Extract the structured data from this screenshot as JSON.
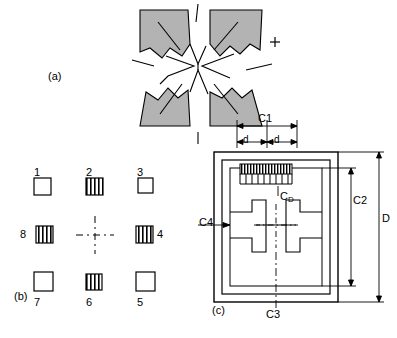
{
  "figure": {
    "panels": [
      {
        "id": "a",
        "label": "(a)",
        "description": "irregular shaded cross-shaped antenna element outline"
      },
      {
        "id": "b",
        "label": "(b)",
        "description": "array of eight numbered square elements around a dashed cross center"
      },
      {
        "id": "c",
        "label": "(c)",
        "description": "square patch layout with dimension callouts"
      }
    ]
  },
  "panel_b": {
    "label": "(b)",
    "elements": [
      {
        "number": "1",
        "position": "top-left",
        "fill": "open"
      },
      {
        "number": "2",
        "position": "top-center",
        "fill": "hatched"
      },
      {
        "number": "3",
        "position": "top-right",
        "fill": "open"
      },
      {
        "number": "8",
        "position": "middle-left",
        "fill": "hatched"
      },
      {
        "number": "4",
        "position": "middle-right",
        "fill": "hatched"
      },
      {
        "number": "7",
        "position": "bottom-left",
        "fill": "open"
      },
      {
        "number": "6",
        "position": "bottom-center",
        "fill": "hatched"
      },
      {
        "number": "5",
        "position": "bottom-right",
        "fill": "open"
      }
    ]
  },
  "panel_c": {
    "label": "(c)",
    "dimensions": [
      {
        "name": "C1",
        "text": "C1"
      },
      {
        "name": "C2",
        "text": "C2"
      },
      {
        "name": "C3",
        "text": "C3"
      },
      {
        "name": "C4",
        "text": "C4"
      },
      {
        "name": "CD",
        "text": "C",
        "sub": "D"
      },
      {
        "name": "D",
        "text": "D"
      },
      {
        "name": "d-left",
        "text": "d"
      },
      {
        "name": "d-right",
        "text": "d"
      }
    ]
  },
  "panel_a": {
    "label": "(a)"
  },
  "colors": {
    "line": "#000000",
    "shade": "#b3b3b3",
    "background": "#ffffff"
  }
}
